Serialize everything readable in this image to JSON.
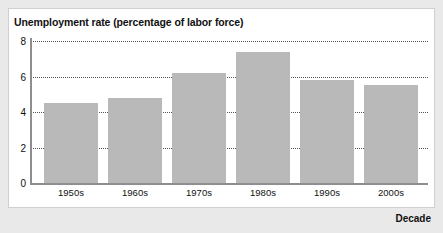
{
  "chart_data": {
    "type": "bar",
    "title": "Unemployment rate (percentage of labor force)",
    "xlabel": "Decade",
    "ylabel": "",
    "categories": [
      "1950s",
      "1960s",
      "1970s",
      "1980s",
      "1990s",
      "2000s"
    ],
    "values": [
      4.5,
      4.8,
      6.2,
      7.4,
      5.8,
      5.5
    ],
    "ylim": [
      0,
      8
    ],
    "yticks": [
      0,
      2,
      4,
      6,
      8
    ],
    "ytick_labels": [
      "0",
      "2",
      "4",
      "6",
      "8"
    ],
    "grid": true,
    "grid_style": "dotted-horizontal",
    "legend": null,
    "bar_color": "#b9b9b9",
    "axis_color": "#8e8e8e",
    "panel_background": "#ffffff",
    "page_background": "#e9e9e9"
  }
}
